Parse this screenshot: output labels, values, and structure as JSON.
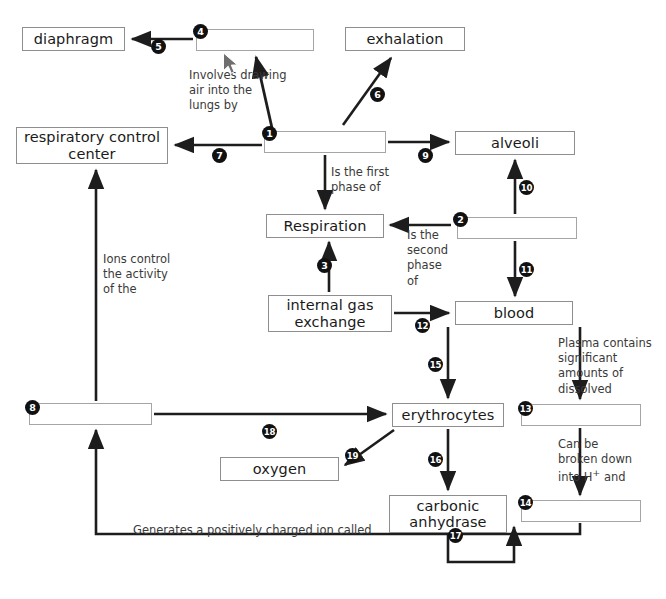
{
  "diagram": {
    "line_color": "#1d1d1d",
    "box_border_color": "#9a9a9a",
    "bullet_color": "#111111",
    "background": "#ffffff"
  },
  "boxes": [
    {
      "id": "diaphragm",
      "label": "diaphragm",
      "blank": false,
      "x": 22,
      "y": 27,
      "w": 103,
      "h": 24
    },
    {
      "id": "blank4",
      "label": "",
      "blank": true,
      "x": 196,
      "y": 29,
      "w": 118,
      "h": 22
    },
    {
      "id": "exhalation",
      "label": "exhalation",
      "blank": false,
      "x": 345,
      "y": 27,
      "w": 120,
      "h": 24
    },
    {
      "id": "respiratory-center",
      "label": "respiratory control\ncenter",
      "blank": false,
      "x": 16,
      "y": 127,
      "w": 152,
      "h": 37
    },
    {
      "id": "blank1",
      "label": "",
      "blank": true,
      "x": 264,
      "y": 131,
      "w": 122,
      "h": 22
    },
    {
      "id": "alveoli",
      "label": "alveoli",
      "blank": false,
      "x": 455,
      "y": 131,
      "w": 120,
      "h": 24
    },
    {
      "id": "respiration",
      "label": "Respiration",
      "blank": false,
      "x": 266,
      "y": 214,
      "w": 118,
      "h": 24
    },
    {
      "id": "blank2",
      "label": "",
      "blank": true,
      "x": 457,
      "y": 217,
      "w": 120,
      "h": 22
    },
    {
      "id": "internal-gas",
      "label": "internal gas\nexchange",
      "blank": false,
      "x": 268,
      "y": 295,
      "w": 124,
      "h": 37
    },
    {
      "id": "blood",
      "label": "blood",
      "blank": false,
      "x": 455,
      "y": 301,
      "w": 118,
      "h": 24
    },
    {
      "id": "blank8",
      "label": "",
      "blank": true,
      "x": 29,
      "y": 403,
      "w": 123,
      "h": 22
    },
    {
      "id": "erythrocytes",
      "label": "erythrocytes",
      "blank": false,
      "x": 392,
      "y": 403,
      "w": 112,
      "h": 24
    },
    {
      "id": "blank13",
      "label": "",
      "blank": true,
      "x": 521,
      "y": 404,
      "w": 120,
      "h": 22
    },
    {
      "id": "oxygen",
      "label": "oxygen",
      "blank": false,
      "x": 220,
      "y": 457,
      "w": 119,
      "h": 24
    },
    {
      "id": "carbonic-anhydrase",
      "label": "carbonic\nanhydrase",
      "blank": false,
      "x": 389,
      "y": 495,
      "w": 118,
      "h": 38
    },
    {
      "id": "blank14",
      "label": "",
      "blank": true,
      "x": 521,
      "y": 500,
      "w": 120,
      "h": 22
    }
  ],
  "phrases": [
    {
      "id": "p-involves",
      "text": "Involves drawing\nair into the\nlungs by",
      "x": 189,
      "y": 68
    },
    {
      "id": "p-first",
      "text": "Is the first\nphase of",
      "x": 331,
      "y": 165
    },
    {
      "id": "p-second",
      "text": "Is the\nsecond\nphase\nof",
      "x": 407,
      "y": 228
    },
    {
      "id": "p-ions",
      "text": "Ions control\nthe activity\nof the",
      "x": 103,
      "y": 252
    },
    {
      "id": "p-plasma",
      "text": "Plasma contains\nsignificant\namounts of\ndissolved",
      "x": 558,
      "y": 336
    },
    {
      "id": "p-broken",
      "text": "Can be\nbroken down\ninto H<sup>+</sup> and",
      "html": true,
      "x": 558,
      "y": 437
    },
    {
      "id": "p-generates",
      "text": "Generates a positively charged ion called",
      "x": 133,
      "y": 523
    }
  ],
  "bullets": [
    {
      "n": "1",
      "x": 262,
      "y": 126
    },
    {
      "n": "2",
      "x": 453,
      "y": 212
    },
    {
      "n": "3",
      "x": 317,
      "y": 258
    },
    {
      "n": "4",
      "x": 193,
      "y": 24
    },
    {
      "n": "5",
      "x": 151,
      "y": 39
    },
    {
      "n": "6",
      "x": 370,
      "y": 87
    },
    {
      "n": "7",
      "x": 212,
      "y": 148
    },
    {
      "n": "8",
      "x": 25,
      "y": 400
    },
    {
      "n": "9",
      "x": 418,
      "y": 148
    },
    {
      "n": "10",
      "x": 519,
      "y": 180
    },
    {
      "n": "11",
      "x": 519,
      "y": 262
    },
    {
      "n": "12",
      "x": 415,
      "y": 318
    },
    {
      "n": "13",
      "x": 518,
      "y": 401
    },
    {
      "n": "14",
      "x": 518,
      "y": 495
    },
    {
      "n": "15",
      "x": 428,
      "y": 357
    },
    {
      "n": "16",
      "x": 428,
      "y": 452
    },
    {
      "n": "17",
      "x": 448,
      "y": 528
    },
    {
      "n": "18",
      "x": 262,
      "y": 424
    },
    {
      "n": "19",
      "x": 345,
      "y": 448
    }
  ],
  "cursor": {
    "x": 222,
    "y": 52,
    "visible": true
  }
}
